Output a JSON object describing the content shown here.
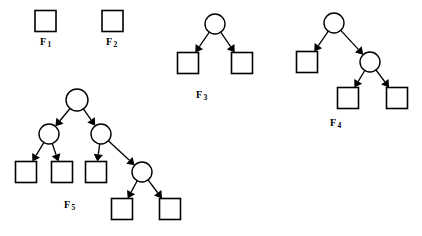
{
  "figure": {
    "background_color": "#ffffff",
    "stroke_color": "#000000",
    "node_fill_color": "#ffffff",
    "width": 422,
    "height": 236
  },
  "trees": [
    {
      "id": "F1",
      "label_base": "F",
      "label_sub": "1",
      "label_x": 40,
      "label_y": 36,
      "node_count": 1,
      "circle_count": 0,
      "square_count": 1,
      "edge_count": 0,
      "nodes": [
        {
          "name": "f1-leaf",
          "shape": "square",
          "cx": 45.5,
          "cy": 21,
          "size": 21
        }
      ],
      "edges": []
    },
    {
      "id": "F2",
      "label_base": "F",
      "label_sub": "2",
      "label_x": 106,
      "label_y": 36,
      "node_count": 1,
      "circle_count": 0,
      "square_count": 1,
      "edge_count": 0,
      "nodes": [
        {
          "name": "f2-leaf",
          "shape": "square",
          "cx": 112.5,
          "cy": 21,
          "size": 21
        }
      ],
      "edges": []
    },
    {
      "id": "F3",
      "label_base": "F",
      "label_sub": "3",
      "label_x": 196,
      "label_y": 89,
      "node_count": 3,
      "circle_count": 1,
      "square_count": 2,
      "edge_count": 2,
      "nodes": [
        {
          "name": "f3-root",
          "shape": "circle",
          "cx": 215,
          "cy": 24,
          "r": 10
        },
        {
          "name": "f3-leaf-left",
          "shape": "square",
          "cx": 188,
          "cy": 63,
          "size": 21
        },
        {
          "name": "f3-leaf-right",
          "shape": "square",
          "cx": 242,
          "cy": 63,
          "size": 21
        }
      ],
      "edges": [
        {
          "name": "f3-edge-root-left",
          "from": "f3-root",
          "to": "f3-leaf-left"
        },
        {
          "name": "f3-edge-root-right",
          "from": "f3-root",
          "to": "f3-leaf-right"
        }
      ]
    },
    {
      "id": "F4",
      "label_base": "F",
      "label_sub": "4",
      "label_x": 330,
      "label_y": 117,
      "node_count": 5,
      "circle_count": 2,
      "square_count": 3,
      "edge_count": 4,
      "nodes": [
        {
          "name": "f4-root",
          "shape": "circle",
          "cx": 334,
          "cy": 23,
          "r": 10
        },
        {
          "name": "f4-leaf-left",
          "shape": "square",
          "cx": 307,
          "cy": 62,
          "size": 21
        },
        {
          "name": "f4-inner-right",
          "shape": "circle",
          "cx": 370,
          "cy": 62,
          "r": 10
        },
        {
          "name": "f4-leaf-mid",
          "shape": "square",
          "cx": 348,
          "cy": 98,
          "size": 21
        },
        {
          "name": "f4-leaf-right",
          "shape": "square",
          "cx": 397,
          "cy": 98,
          "size": 21
        }
      ],
      "edges": [
        {
          "name": "f4-edge-root-left",
          "from": "f4-root",
          "to": "f4-leaf-left"
        },
        {
          "name": "f4-edge-root-inner",
          "from": "f4-root",
          "to": "f4-inner-right"
        },
        {
          "name": "f4-edge-inner-mid",
          "from": "f4-inner-right",
          "to": "f4-leaf-mid"
        },
        {
          "name": "f4-edge-inner-right",
          "from": "f4-inner-right",
          "to": "f4-leaf-right"
        }
      ]
    },
    {
      "id": "F5",
      "label_base": "F",
      "label_sub": "5",
      "label_x": 64,
      "label_y": 199,
      "node_count": 9,
      "circle_count": 4,
      "square_count": 5,
      "edge_count": 8,
      "nodes": [
        {
          "name": "f5-root",
          "shape": "circle",
          "cx": 77,
          "cy": 100,
          "r": 11
        },
        {
          "name": "f5-inner-left",
          "shape": "circle",
          "cx": 49,
          "cy": 134,
          "r": 10
        },
        {
          "name": "f5-inner-right",
          "shape": "circle",
          "cx": 101,
          "cy": 134,
          "r": 10
        },
        {
          "name": "f5-leaf-1",
          "shape": "square",
          "cx": 26,
          "cy": 172,
          "size": 21
        },
        {
          "name": "f5-leaf-2",
          "shape": "square",
          "cx": 62,
          "cy": 172,
          "size": 21
        },
        {
          "name": "f5-leaf-3",
          "shape": "square",
          "cx": 96,
          "cy": 172,
          "size": 21
        },
        {
          "name": "f5-inner-deep",
          "shape": "circle",
          "cx": 142,
          "cy": 172,
          "r": 10
        },
        {
          "name": "f5-leaf-4",
          "shape": "square",
          "cx": 122,
          "cy": 209,
          "size": 21
        },
        {
          "name": "f5-leaf-5",
          "shape": "square",
          "cx": 170,
          "cy": 209,
          "size": 21
        }
      ],
      "edges": [
        {
          "name": "f5-edge-root-left",
          "from": "f5-root",
          "to": "f5-inner-left"
        },
        {
          "name": "f5-edge-root-right",
          "from": "f5-root",
          "to": "f5-inner-right"
        },
        {
          "name": "f5-edge-left-leaf1",
          "from": "f5-inner-left",
          "to": "f5-leaf-1"
        },
        {
          "name": "f5-edge-left-leaf2",
          "from": "f5-inner-left",
          "to": "f5-leaf-2"
        },
        {
          "name": "f5-edge-right-leaf3",
          "from": "f5-inner-right",
          "to": "f5-leaf-3"
        },
        {
          "name": "f5-edge-right-deep",
          "from": "f5-inner-right",
          "to": "f5-inner-deep"
        },
        {
          "name": "f5-edge-deep-leaf4",
          "from": "f5-inner-deep",
          "to": "f5-leaf-4"
        },
        {
          "name": "f5-edge-deep-leaf5",
          "from": "f5-inner-deep",
          "to": "f5-leaf-5"
        }
      ]
    }
  ]
}
